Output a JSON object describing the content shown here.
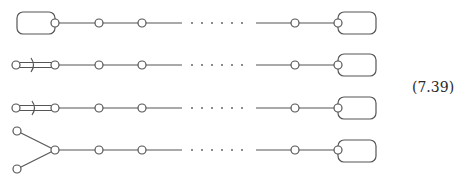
{
  "equation_label": "(7.39)",
  "colors": {
    "stroke": "#555555",
    "background": "#ffffff",
    "text": "#2a2a2a"
  },
  "diagram": {
    "type": "quiver-chains",
    "rows": [
      {
        "index": 1,
        "y": 23,
        "left_end": "rounded-box-loop",
        "right_end": "rounded-box-loop"
      },
      {
        "index": 2,
        "y": 65,
        "left_end": "double-edge-with-crossing",
        "right_end": "rounded-box-loop"
      },
      {
        "index": 3,
        "y": 108,
        "left_end": "double-edge-with-crossing",
        "right_end": "rounded-box-loop"
      },
      {
        "index": 4,
        "y": 150,
        "left_end": "fork-two-nodes",
        "right_end": "rounded-box-loop"
      }
    ],
    "chain": {
      "node_x": [
        55,
        99,
        142,
        295,
        338
      ],
      "solid_left": [
        55,
        182
      ],
      "dots_x": [
        192,
        202,
        212,
        222,
        232,
        242
      ],
      "solid_right": [
        256,
        338
      ],
      "ellipsis": "· · · · · ·"
    }
  }
}
